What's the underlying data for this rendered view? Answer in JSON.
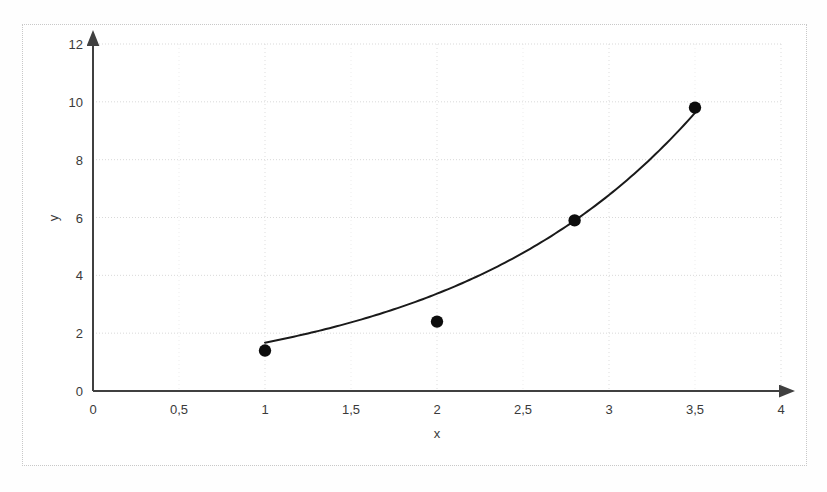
{
  "figure": {
    "background_color": "#ffffff",
    "frame_color": "#c8c8c8",
    "axis_color": "#404040",
    "grid_color": "#d9d9d9",
    "marker_color": "#0d0d0d",
    "curve_color": "#1a1a1a"
  },
  "chart_data": {
    "type": "scatter",
    "title": "",
    "xlabel": "x",
    "ylabel": "y",
    "xlim": [
      0,
      4
    ],
    "ylim": [
      0,
      12
    ],
    "grid": true,
    "legend": "none",
    "x_tick_labels": [
      "0",
      "0,5",
      "1",
      "1,5",
      "2",
      "2,5",
      "3",
      "3,5",
      "4"
    ],
    "x_tick_values": [
      0,
      0.5,
      1,
      1.5,
      2,
      2.5,
      3,
      3.5,
      4
    ],
    "y_tick_labels": [
      "0",
      "2",
      "4",
      "6",
      "8",
      "10",
      "12"
    ],
    "y_tick_values": [
      0,
      2,
      4,
      6,
      8,
      10,
      12
    ],
    "x": [
      1,
      2,
      2.8,
      3.5
    ],
    "values": [
      1.4,
      2.4,
      5.9,
      9.8
    ],
    "points": [
      {
        "x": 1,
        "y": 1.4
      },
      {
        "x": 2,
        "y": 2.4
      },
      {
        "x": 2.8,
        "y": 5.9
      },
      {
        "x": 3.5,
        "y": 9.8
      }
    ],
    "series": [
      {
        "name": "data points",
        "marker": "filled-circle",
        "x": [
          1,
          2,
          2.8,
          3.5
        ],
        "values": [
          1.4,
          2.4,
          5.9,
          9.8
        ]
      },
      {
        "name": "fitted exponential curve",
        "marker": "none",
        "line": "solid",
        "equation": "y = 0.83 * exp(0.70 * x)",
        "x_range": [
          1,
          3.5
        ]
      }
    ],
    "annotations": []
  }
}
